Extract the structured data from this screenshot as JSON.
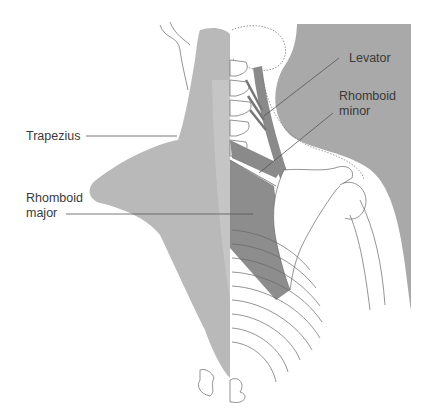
{
  "diagram": {
    "type": "anatomical-illustration",
    "colors": {
      "background": "#ffffff",
      "skin_silhouette": "#a9a9a9",
      "trapezius": "#b9b9b9",
      "trapezius_light": "#c8c8c8",
      "deep_muscles": "#8a8a8a",
      "bone_outline": "#6a6a6a",
      "leader_line": "#555555",
      "label_text": "#3a3a3a"
    },
    "labels": [
      {
        "id": "trapezius",
        "text": "Trapezius",
        "x": 26,
        "y": 129
      },
      {
        "id": "rhomboid-major",
        "text": "Rhomboid\nmajor",
        "x": 26,
        "y": 191
      },
      {
        "id": "levator",
        "text": "Levator",
        "x": 349,
        "y": 51
      },
      {
        "id": "rhomboid-minor",
        "text": "Rhomboid\nminor",
        "x": 339,
        "y": 89
      }
    ]
  }
}
